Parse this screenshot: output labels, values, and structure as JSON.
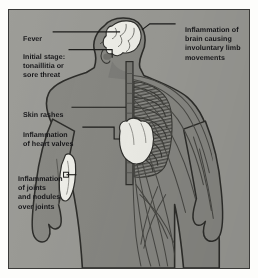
{
  "diagram": {
    "figure_description": "Anterior human body figure, left half shaded as skin and muscle, right half showing nervous system branches and rib cage, with highlighted brain, heart and joint",
    "colors": {
      "background": "#9d9d98",
      "frame": "#3a3a38",
      "body_fill": "#8a8a85",
      "body_shadow": "#6f6f6a",
      "organ_highlight": "#f4f4ee",
      "ink": "#17171a",
      "paper": "#fdfdfb"
    },
    "labels": [
      {
        "id": "fever",
        "text": "Fever",
        "side": "left"
      },
      {
        "id": "initial",
        "text": "Initial stage:\ntonaillitia or\nsore threat",
        "side": "left"
      },
      {
        "id": "rash",
        "text": "Skin rashes",
        "side": "left"
      },
      {
        "id": "heart",
        "text": "Inflammation\nof heart valves",
        "side": "left"
      },
      {
        "id": "joints",
        "text": "Inflammation\nof joints\nand nodules\nover joints",
        "side": "left"
      },
      {
        "id": "brain",
        "text": "Inflammation of\nbrain causing\ninvoluntary limb\nmovements",
        "side": "right"
      }
    ],
    "highlighted_organs": [
      "brain",
      "heart",
      "elbow-joint"
    ]
  }
}
